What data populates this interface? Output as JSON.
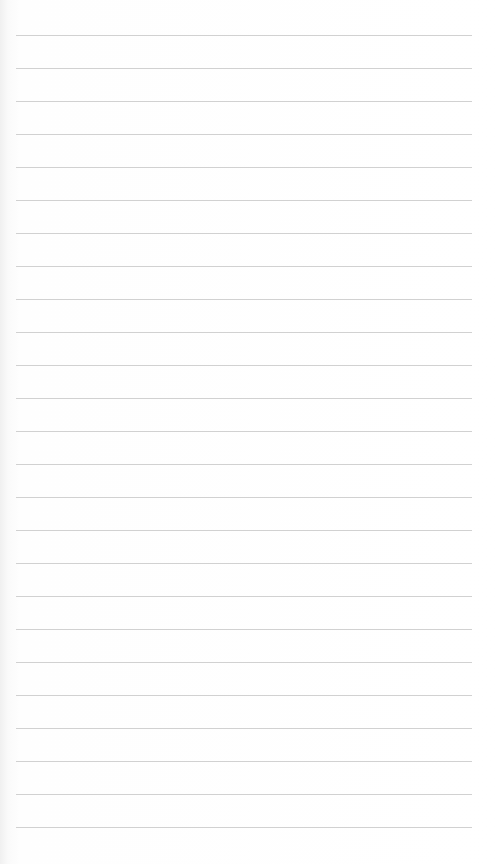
{
  "page": {
    "type": "blank lined paper",
    "line_count": 25,
    "first_line_y": 35,
    "line_spacing": 33,
    "line_left": 16,
    "line_width": 456,
    "line_color": "#c9c9c9",
    "background_color": "#fdfdfd",
    "text": ""
  }
}
